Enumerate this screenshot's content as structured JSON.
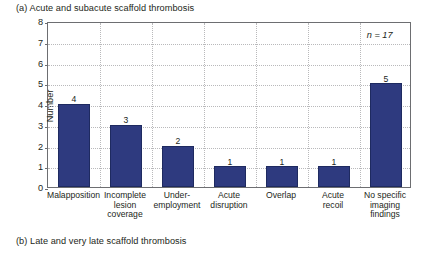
{
  "figure": {
    "caption_a": "(a) Acute and subacute scaffold thrombosis",
    "caption_b": "(b) Late and very late scaffold thrombosis"
  },
  "chart_data": {
    "type": "bar",
    "title": "(a) Acute and subacute scaffold thrombosis",
    "xlabel": "",
    "ylabel": "Number",
    "ylim": [
      0,
      8
    ],
    "yticks": [
      "0",
      "1",
      "2",
      "3",
      "4",
      "5",
      "6",
      "7",
      "8"
    ],
    "grid": "horizontal-and-vertical-dotted",
    "legend": "none",
    "bar_color": "#2e3a7f",
    "categories": [
      "Malapposition",
      "Incomplete lesion coverage",
      "Under-employment",
      "Acute disruption",
      "Overlap",
      "Acute recoil",
      "No specific imaging findings"
    ],
    "category_label_lines": [
      [
        "Malapposition"
      ],
      [
        "Incomplete",
        "lesion",
        "coverage"
      ],
      [
        "Under-",
        "employment"
      ],
      [
        "Acute",
        "disruption"
      ],
      [
        "Overlap"
      ],
      [
        "Acute",
        "recoil"
      ],
      [
        "No specific",
        "imaging",
        "findings"
      ]
    ],
    "values": [
      4,
      3,
      2,
      1,
      1,
      1,
      5
    ],
    "data_labels": [
      "4",
      "3",
      "2",
      "1",
      "1",
      "1",
      "5"
    ],
    "annotations": [
      {
        "text": "n = 17",
        "x_category": "No specific imaging findings",
        "y": 7.4
      }
    ]
  }
}
